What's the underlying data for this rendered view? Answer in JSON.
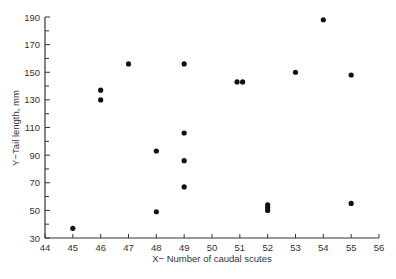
{
  "chart_data": {
    "type": "scatter",
    "title": "",
    "xlabel": "X− Number of caudal scutes",
    "ylabel": "Y−Tail length, mm",
    "xlim": [
      44,
      56
    ],
    "ylim": [
      30,
      190
    ],
    "x_ticks": [
      44,
      45,
      46,
      47,
      48,
      49,
      50,
      51,
      52,
      53,
      54,
      55,
      56
    ],
    "y_ticks": [
      30,
      50,
      70,
      90,
      110,
      130,
      150,
      170,
      190
    ],
    "y_minor_ticks": [
      40,
      60,
      80,
      100,
      120,
      140,
      160,
      180
    ],
    "grid": false,
    "legend": null,
    "points": [
      {
        "x": 45,
        "y": 37
      },
      {
        "x": 46,
        "y": 137
      },
      {
        "x": 46,
        "y": 130
      },
      {
        "x": 47,
        "y": 156
      },
      {
        "x": 48,
        "y": 93
      },
      {
        "x": 48,
        "y": 49
      },
      {
        "x": 49,
        "y": 156
      },
      {
        "x": 49,
        "y": 106
      },
      {
        "x": 49,
        "y": 86
      },
      {
        "x": 49,
        "y": 67
      },
      {
        "x": 50.9,
        "y": 143
      },
      {
        "x": 51.1,
        "y": 143
      },
      {
        "x": 52,
        "y": 54
      },
      {
        "x": 52,
        "y": 52
      },
      {
        "x": 52,
        "y": 50
      },
      {
        "x": 53,
        "y": 150
      },
      {
        "x": 54,
        "y": 188
      },
      {
        "x": 55,
        "y": 148
      },
      {
        "x": 55,
        "y": 55
      }
    ]
  }
}
